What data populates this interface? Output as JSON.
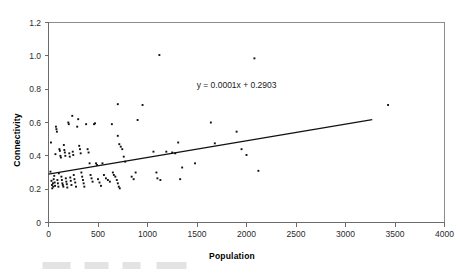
{
  "chart_data": {
    "type": "scatter",
    "title": "",
    "xlabel": "Population",
    "ylabel": "Connectivity",
    "xlim": [
      0,
      4000
    ],
    "ylim": [
      0,
      1.2
    ],
    "xticks": [
      "0",
      "500",
      "1000",
      "1500",
      "2000",
      "2500",
      "3000",
      "3500",
      "4000"
    ],
    "xtick_values": [
      0,
      500,
      1000,
      1500,
      2000,
      2500,
      3000,
      3500,
      4000
    ],
    "yticks": [
      "0",
      "0.2",
      "0.4",
      "0.6",
      "0.8",
      "1.0",
      "1.2"
    ],
    "ytick_values": [
      0,
      0.2,
      0.4,
      0.6,
      0.8,
      1.0,
      1.2
    ],
    "grid": false,
    "legend": "none",
    "marker": "filled-square-small",
    "marker_color": "#101010",
    "trendline": {
      "label": "y = 0.0001x + 0.2903",
      "slope": 0.0001,
      "intercept": 0.2903,
      "x_start": 0,
      "x_end": 3270,
      "color": "#111111",
      "label_x": 1900,
      "label_y": 0.805
    },
    "series": [
      {
        "name": "Settlements",
        "points": [
          [
            20,
            0.305
          ],
          [
            25,
            0.48
          ],
          [
            30,
            0.25
          ],
          [
            35,
            0.225
          ],
          [
            38,
            0.205
          ],
          [
            45,
            0.235
          ],
          [
            48,
            0.215
          ],
          [
            52,
            0.26
          ],
          [
            58,
            0.28
          ],
          [
            62,
            0.24
          ],
          [
            66,
            0.22
          ],
          [
            70,
            0.41
          ],
          [
            75,
            0.575
          ],
          [
            80,
            0.56
          ],
          [
            85,
            0.545
          ],
          [
            90,
            0.255
          ],
          [
            95,
            0.235
          ],
          [
            100,
            0.215
          ],
          [
            105,
            0.295
          ],
          [
            110,
            0.44
          ],
          [
            115,
            0.43
          ],
          [
            120,
            0.4
          ],
          [
            125,
            0.39
          ],
          [
            130,
            0.275
          ],
          [
            135,
            0.255
          ],
          [
            140,
            0.235
          ],
          [
            145,
            0.225
          ],
          [
            150,
            0.215
          ],
          [
            155,
            0.465
          ],
          [
            160,
            0.435
          ],
          [
            165,
            0.42
          ],
          [
            170,
            0.4
          ],
          [
            175,
            0.265
          ],
          [
            180,
            0.245
          ],
          [
            185,
            0.23
          ],
          [
            190,
            0.21
          ],
          [
            200,
            0.6
          ],
          [
            205,
            0.59
          ],
          [
            210,
            0.415
          ],
          [
            215,
            0.395
          ],
          [
            220,
            0.27
          ],
          [
            225,
            0.25
          ],
          [
            232,
            0.225
          ],
          [
            240,
            0.64
          ],
          [
            245,
            0.425
          ],
          [
            250,
            0.405
          ],
          [
            255,
            0.285
          ],
          [
            262,
            0.26
          ],
          [
            270,
            0.24
          ],
          [
            278,
            0.215
          ],
          [
            290,
            0.575
          ],
          [
            300,
            0.62
          ],
          [
            310,
            0.46
          ],
          [
            318,
            0.44
          ],
          [
            325,
            0.415
          ],
          [
            332,
            0.3
          ],
          [
            340,
            0.275
          ],
          [
            348,
            0.255
          ],
          [
            355,
            0.235
          ],
          [
            362,
            0.215
          ],
          [
            380,
            0.59
          ],
          [
            395,
            0.44
          ],
          [
            405,
            0.42
          ],
          [
            415,
            0.355
          ],
          [
            425,
            0.285
          ],
          [
            435,
            0.265
          ],
          [
            445,
            0.245
          ],
          [
            460,
            0.59
          ],
          [
            470,
            0.595
          ],
          [
            480,
            0.355
          ],
          [
            490,
            0.345
          ],
          [
            500,
            0.26
          ],
          [
            515,
            0.24
          ],
          [
            530,
            0.22
          ],
          [
            545,
            0.355
          ],
          [
            560,
            0.285
          ],
          [
            580,
            0.265
          ],
          [
            600,
            0.255
          ],
          [
            620,
            0.245
          ],
          [
            640,
            0.59
          ],
          [
            650,
            0.3
          ],
          [
            660,
            0.285
          ],
          [
            675,
            0.275
          ],
          [
            690,
            0.255
          ],
          [
            700,
            0.235
          ],
          [
            710,
            0.215
          ],
          [
            720,
            0.205
          ],
          [
            700,
            0.52
          ],
          [
            715,
            0.47
          ],
          [
            730,
            0.455
          ],
          [
            745,
            0.44
          ],
          [
            760,
            0.395
          ],
          [
            775,
            0.365
          ],
          [
            700,
            0.71
          ],
          [
            1120,
            1.005
          ],
          [
            950,
            0.705
          ],
          [
            900,
            0.615
          ],
          [
            840,
            0.275
          ],
          [
            860,
            0.26
          ],
          [
            880,
            0.3
          ],
          [
            1060,
            0.425
          ],
          [
            1090,
            0.3
          ],
          [
            1100,
            0.265
          ],
          [
            1130,
            0.255
          ],
          [
            1190,
            0.425
          ],
          [
            1250,
            0.42
          ],
          [
            1280,
            0.415
          ],
          [
            1310,
            0.48
          ],
          [
            1330,
            0.26
          ],
          [
            1350,
            0.33
          ],
          [
            1480,
            0.355
          ],
          [
            1640,
            0.6
          ],
          [
            1680,
            0.475
          ],
          [
            1900,
            0.545
          ],
          [
            1950,
            0.44
          ],
          [
            2000,
            0.405
          ],
          [
            2080,
            0.985
          ],
          [
            2120,
            0.31
          ],
          [
            3430,
            0.705
          ]
        ]
      }
    ]
  },
  "axis": {
    "x_title": "Population",
    "y_title": "Connectivity"
  },
  "annotations": {
    "equation": "y = 0.0001x + 0.2903"
  }
}
